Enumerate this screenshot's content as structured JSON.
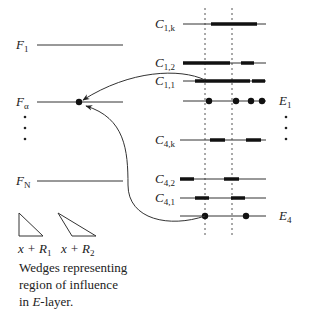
{
  "diagram": {
    "colors": {
      "ink": "#222222",
      "background": "#ffffff"
    },
    "f_layer": {
      "lines": [
        {
          "id": "F1",
          "main": "F",
          "sub": "1",
          "y": 45
        },
        {
          "id": "Falpha",
          "main": "F",
          "sub": "α",
          "y": 102
        },
        {
          "id": "FN",
          "main": "F",
          "sub": "N",
          "y": 181
        }
      ],
      "focus_node": {
        "x": 79,
        "y": 102
      }
    },
    "c_layer": {
      "lines": [
        {
          "id": "C1k",
          "main": "C",
          "sub": "1,k",
          "y": 24,
          "bars": [
            [
              211,
              257
            ]
          ]
        },
        {
          "id": "C12",
          "main": "C",
          "sub": "1,2",
          "y": 63,
          "bars": [
            [
              183,
              230
            ],
            [
              241,
              254
            ]
          ]
        },
        {
          "id": "C11",
          "main": "C",
          "sub": "1,1",
          "y": 81,
          "bars": [
            [
              195,
              250
            ],
            [
              252,
              265
            ]
          ]
        },
        {
          "id": "C4k",
          "main": "C",
          "sub": "4,k",
          "y": 140,
          "bars": [
            [
              210,
              225
            ],
            [
              246,
              261
            ]
          ]
        },
        {
          "id": "C42",
          "main": "C",
          "sub": "4,2",
          "y": 179,
          "bars": [
            [
              180,
              194
            ],
            [
              224,
              239
            ]
          ]
        },
        {
          "id": "C41",
          "main": "C",
          "sub": "4,1",
          "y": 198,
          "bars": [
            [
              195,
              209
            ],
            [
              231,
              245
            ]
          ]
        }
      ]
    },
    "e_layer": {
      "lines": [
        {
          "id": "E1",
          "main": "E",
          "sub": "1",
          "y": 101,
          "dots": [
            209,
            236,
            251,
            262
          ]
        },
        {
          "id": "E4",
          "main": "E",
          "sub": "4",
          "y": 216,
          "dots": [
            205,
            246
          ]
        }
      ]
    },
    "dashed_guides_x": [
      205,
      232
    ],
    "wedges": [
      {
        "id": "wedge-r1",
        "label_expr": "x + R",
        "label_sub": "1"
      },
      {
        "id": "wedge-r2",
        "label_expr": "x + R",
        "label_sub": "2"
      }
    ],
    "caption": {
      "line1": "Wedges representing",
      "line2": "region of influence",
      "line3_prefix": "in ",
      "line3_italic": "E",
      "line3_suffix": "-layer."
    }
  }
}
